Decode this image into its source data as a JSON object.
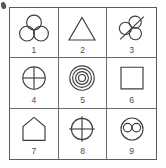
{
  "diagram": {
    "type": "3x3 figure grid",
    "rows": 3,
    "columns": 3,
    "stroke_color": "#3d3d3d",
    "border_color": "#5c5c5c",
    "background_color": "#ffffff",
    "cells": [
      {
        "number": "1",
        "icon": "three-circles-cluster-icon",
        "description": "Three equal circles arranged in a triangular cluster, one on top and two below, mutually tangent"
      },
      {
        "number": "2",
        "icon": "triangle-icon",
        "description": "An upward pointing equilateral triangle outline"
      },
      {
        "number": "3",
        "icon": "three-circles-cluster-struck-icon",
        "description": "Three small circles in a rotated cluster with a diagonal line struck through them"
      },
      {
        "number": "4",
        "icon": "circle-with-cross-icon",
        "description": "A circle outline divided by a vertical and a horizontal diameter"
      },
      {
        "number": "5",
        "icon": "concentric-circles-icon",
        "description": "Four concentric circles sharing one centre"
      },
      {
        "number": "6",
        "icon": "square-icon",
        "description": "A plain square outline"
      },
      {
        "number": "7",
        "icon": "house-pentagon-icon",
        "description": "A house shape: a square base topped with a triangular roof"
      },
      {
        "number": "8",
        "icon": "crosshair-icon",
        "description": "A circle with vertical and horizontal lines extending past its edge, forming a crosshair"
      },
      {
        "number": "9",
        "icon": "circle-with-two-circles-icon",
        "description": "A large circle containing two small circles side by side"
      }
    ]
  }
}
